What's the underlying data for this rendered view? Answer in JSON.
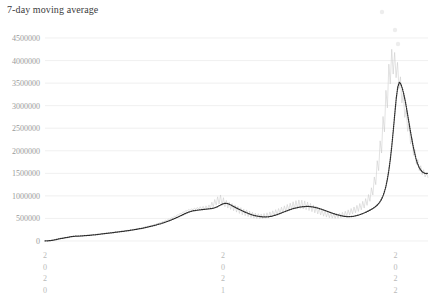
{
  "chart": {
    "title": "7-day moving average"
  },
  "chart_data": {
    "type": "line",
    "title": "7-day moving average",
    "xlabel": "",
    "ylabel": "",
    "grid": true,
    "legend": false,
    "xlim": [
      "2020",
      "2022"
    ],
    "ylim": [
      0,
      4500000
    ],
    "ytick_labels": [
      "4500000",
      "4000000",
      "3500000",
      "3000000",
      "2500000",
      "2000000",
      "1500000",
      "1000000",
      "500000",
      "0"
    ],
    "ytick_values": [
      4500000,
      4000000,
      3500000,
      3000000,
      2500000,
      2000000,
      1500000,
      1000000,
      500000,
      0
    ],
    "xtick_labels": [
      "2020",
      "2021",
      "2022"
    ],
    "xtick_positions": [
      0.0,
      0.465,
      0.915
    ],
    "series": [
      {
        "name": "raw-daily",
        "color": "#c9c9c9",
        "style": "solid-thin",
        "values": [
          2000,
          3000,
          4000,
          6000,
          9000,
          14000,
          21000,
          30000,
          38000,
          44000,
          50000,
          56000,
          62000,
          68000,
          74000,
          80000,
          86000,
          92000,
          98000,
          104000,
          100000,
          112000,
          96000,
          118000,
          102000,
          124000,
          108000,
          130000,
          114000,
          136000,
          120000,
          142000,
          126000,
          148000,
          132000,
          154000,
          140000,
          160000,
          148000,
          166000,
          156000,
          172000,
          164000,
          180000,
          172000,
          188000,
          180000,
          196000,
          190000,
          205000,
          198000,
          214000,
          206000,
          222000,
          214000,
          230000,
          224000,
          240000,
          234000,
          250000,
          244000,
          262000,
          256000,
          274000,
          268000,
          286000,
          280000,
          300000,
          294000,
          314000,
          310000,
          332000,
          326000,
          350000,
          344000,
          368000,
          362000,
          386000,
          382000,
          408000,
          404000,
          432000,
          428000,
          458000,
          452000,
          486000,
          478000,
          516000,
          508000,
          548000,
          540000,
          580000,
          572000,
          612000,
          604000,
          644000,
          636000,
          676000,
          660000,
          700000,
          680000,
          715000,
          690000,
          730000,
          700000,
          745000,
          710000,
          760000,
          700000,
          770000,
          690000,
          780000,
          700000,
          800000,
          720000,
          860000,
          760000,
          920000,
          800000,
          980000,
          820000,
          1020000,
          790000,
          960000,
          760000,
          900000,
          730000,
          860000,
          700000,
          830000,
          670000,
          800000,
          640000,
          770000,
          610000,
          740000,
          580000,
          710000,
          560000,
          690000,
          540000,
          665000,
          520000,
          640000,
          505000,
          620000,
          495000,
          605000,
          490000,
          600000,
          495000,
          610000,
          505000,
          625000,
          520000,
          645000,
          540000,
          670000,
          560000,
          695000,
          585000,
          720000,
          610000,
          750000,
          635000,
          780000,
          660000,
          810000,
          680000,
          840000,
          700000,
          870000,
          715000,
          895000,
          725000,
          910000,
          720000,
          905000,
          710000,
          890000,
          695000,
          865000,
          675000,
          835000,
          650000,
          800000,
          625000,
          765000,
          600000,
          730000,
          575000,
          700000,
          550000,
          670000,
          530000,
          645000,
          515000,
          625000,
          505000,
          610000,
          500000,
          605000,
          505000,
          615000,
          515000,
          635000,
          530000,
          660000,
          550000,
          690000,
          575000,
          720000,
          600000,
          755000,
          625000,
          790000,
          655000,
          830000,
          690000,
          880000,
          730000,
          940000,
          790000,
          1030000,
          880000,
          1180000,
          1020000,
          1420000,
          1250000,
          1780000,
          1560000,
          2220000,
          1950000,
          2760000,
          2420000,
          3340000,
          2950000,
          3920000,
          3480000,
          4250000,
          3700000,
          4180000,
          3620000,
          3960000,
          3380000,
          3640000,
          3060000,
          3280000,
          2740000,
          2920000,
          2430000,
          2580000,
          2150000,
          2280000,
          1900000,
          2020000,
          1700000,
          1810000,
          1560000,
          1670000,
          1470000,
          1580000,
          1420000,
          1520000,
          1400000
        ]
      },
      {
        "name": "7-day moving average",
        "color": "#2b2b2b",
        "style": "dotted",
        "values": [
          2500,
          3500,
          5000,
          7500,
          11000,
          16000,
          23000,
          31000,
          38000,
          45000,
          51000,
          57000,
          63000,
          69000,
          75000,
          81000,
          87000,
          93000,
          99000,
          104000,
          106000,
          107000,
          108000,
          110000,
          112000,
          114000,
          117000,
          120000,
          122000,
          125000,
          128000,
          131000,
          134000,
          137000,
          141000,
          145000,
          149000,
          153000,
          157000,
          161000,
          165000,
          169000,
          173000,
          177000,
          181000,
          185000,
          190000,
          195000,
          199000,
          203000,
          207000,
          211000,
          215000,
          220000,
          224000,
          229000,
          234000,
          239000,
          244000,
          250000,
          255000,
          261000,
          267000,
          273000,
          279000,
          286000,
          293000,
          300000,
          307000,
          315000,
          323000,
          331000,
          340000,
          349000,
          358000,
          367000,
          377000,
          387000,
          398000,
          409000,
          420000,
          432000,
          444000,
          457000,
          470000,
          484000,
          498000,
          513000,
          528000,
          544000,
          560000,
          576000,
          592000,
          608000,
          622000,
          636000,
          648000,
          658000,
          666000,
          673000,
          678000,
          682000,
          686000,
          690000,
          694000,
          698000,
          702000,
          706000,
          710000,
          714000,
          718000,
          724000,
          732000,
          742000,
          755000,
          772000,
          790000,
          808000,
          822000,
          832000,
          836000,
          830000,
          818000,
          802000,
          784000,
          766000,
          748000,
          730000,
          714000,
          698000,
          682000,
          666000,
          650000,
          636000,
          622000,
          608000,
          596000,
          584000,
          574000,
          566000,
          558000,
          551000,
          545000,
          540000,
          536000,
          534000,
          533000,
          534000,
          537000,
          541000,
          547000,
          555000,
          564000,
          574000,
          586000,
          598000,
          611000,
          624000,
          637000,
          650000,
          663000,
          676000,
          688000,
          700000,
          711000,
          721000,
          730000,
          738000,
          745000,
          751000,
          756000,
          760000,
          763000,
          765000,
          766000,
          765000,
          762000,
          758000,
          752000,
          745000,
          737000,
          728000,
          718000,
          707000,
          696000,
          684000,
          672000,
          660000,
          648000,
          636000,
          624000,
          612000,
          601000,
          590000,
          580000,
          571000,
          563000,
          556000,
          550000,
          545000,
          542000,
          540000,
          540000,
          542000,
          546000,
          551000,
          558000,
          566000,
          576000,
          587000,
          599000,
          612000,
          626000,
          641000,
          657000,
          674000,
          692000,
          712000,
          734000,
          758000,
          786000,
          820000,
          862000,
          916000,
          986000,
          1080000,
          1200000,
          1360000,
          1560000,
          1810000,
          2110000,
          2460000,
          2830000,
          3180000,
          3420000,
          3520000,
          3480000,
          3380000,
          3250000,
          3090000,
          2900000,
          2700000,
          2500000,
          2310000,
          2130000,
          1970000,
          1830000,
          1720000,
          1640000,
          1580000,
          1540000,
          1515000,
          1500000,
          1495000,
          1500000
        ]
      }
    ],
    "annotations": {
      "peak_moving_average": 3520000,
      "peak_raw_daily": 4250000,
      "final_value": 1500000
    }
  }
}
